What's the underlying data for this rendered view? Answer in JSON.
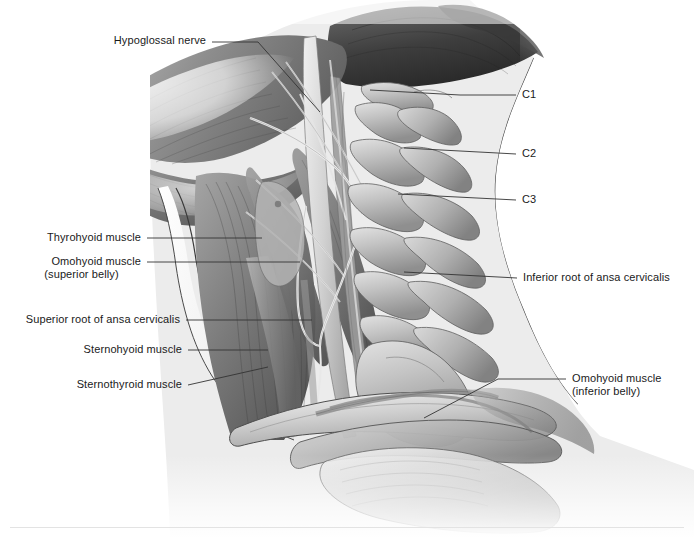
{
  "figure": {
    "style": "grayscale medical illustration",
    "colors": {
      "page_background": "#ffffff",
      "neck_field": "#ececec",
      "muscle_mid": "#8a8a8a",
      "muscle_dark": "#555555",
      "bone_light": "#cfcfcf",
      "bone_shadow": "#9a9a9a",
      "outline": "#3a3a3a",
      "leader_line": "#333333",
      "label_text": "#1a1a1a",
      "footer_rule": "#e3e3e3"
    }
  },
  "labels": {
    "hypoglossal_nerve": "Hypoglossal nerve",
    "thyrohyoid_muscle": "Thyrohyoid muscle",
    "omohyoid_superior_line1": "Omohyoid muscle",
    "omohyoid_superior_line2": "(superior belly)",
    "superior_root": "Superior root of ansa cervicalis",
    "sternohyoid_muscle": "Sternohyoid muscle",
    "sternothyroid_muscle": "Sternothyroid muscle",
    "c1": "C1",
    "c2": "C2",
    "c3": "C3",
    "inferior_root": "Inferior root of ansa cervicalis",
    "omohyoid_inferior_line1": "Omohyoid muscle",
    "omohyoid_inferior_line2": "(inferior belly)"
  }
}
